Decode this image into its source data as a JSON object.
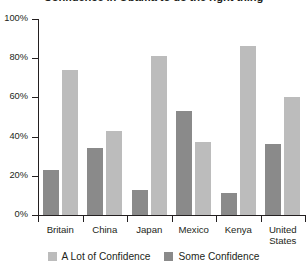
{
  "chart_data": {
    "type": "bar",
    "title": "Confidence in Obama to do the right thing",
    "xlabel": "",
    "ylabel": "",
    "ylim": [
      0,
      100
    ],
    "ytick_labels": [
      "0%",
      "20%",
      "40%",
      "60%",
      "80%",
      "100%"
    ],
    "ytick_values": [
      0,
      20,
      40,
      60,
      80,
      100
    ],
    "grid": false,
    "legend_position": "bottom",
    "value_suffix": "%",
    "categories": [
      "Britain",
      "China",
      "Japan",
      "Mexico",
      "Kenya",
      "United States"
    ],
    "series": [
      {
        "name": "Some Confidence",
        "color": "#8a8a8a",
        "values": [
          23,
          34,
          13,
          53,
          11,
          36
        ]
      },
      {
        "name": "A Lot of Confidence",
        "color": "#bcbcbc",
        "values": [
          74,
          43,
          81,
          37,
          86,
          60
        ]
      }
    ],
    "series_draw_order": [
      "Some Confidence",
      "A Lot of Confidence"
    ],
    "legend": [
      {
        "label": "A Lot of Confidence",
        "color": "#bcbcbc"
      },
      {
        "label": "Some Confidence",
        "color": "#8a8a8a"
      }
    ]
  }
}
